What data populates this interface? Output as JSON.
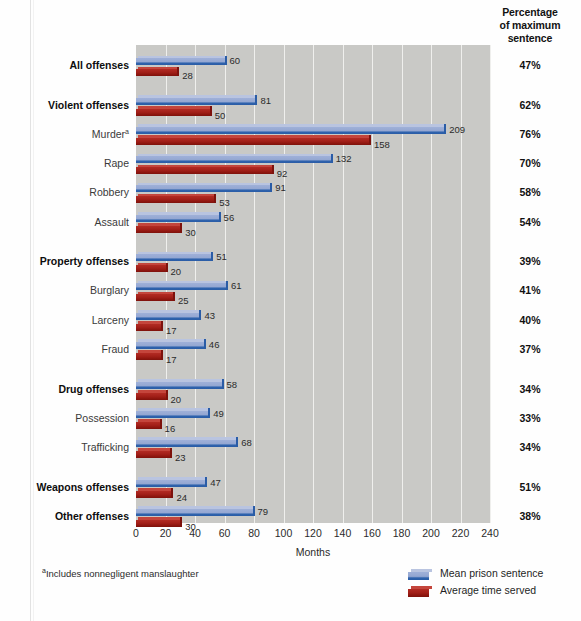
{
  "header": {
    "pct_column_title_line1": "Percentage",
    "pct_column_title_line2": "of maximum",
    "pct_column_title_line3": "sentence"
  },
  "footnote": {
    "marker": "a",
    "text": "Includes nonnegligent manslaughter"
  },
  "legend": {
    "items": [
      {
        "label": "Mean prison sentence",
        "color": "#8fa3cd",
        "icon": "blue-bar-swatch"
      },
      {
        "label": "Average time served",
        "color": "#a32019",
        "icon": "red-bar-swatch"
      }
    ]
  },
  "chart_data": {
    "type": "bar",
    "orientation": "horizontal",
    "title": "",
    "xlabel": "Months",
    "ylabel": "",
    "xlim": [
      0,
      240
    ],
    "xticks": [
      0,
      20,
      40,
      60,
      80,
      100,
      120,
      140,
      160,
      180,
      200,
      220,
      240
    ],
    "xtick_labels": [
      "0",
      "20",
      "40",
      "60",
      "80",
      "100",
      "120",
      "140",
      "160",
      "180",
      "200",
      "220",
      "240"
    ],
    "grid": true,
    "legend_position": "bottom-right",
    "plot_background": "#c9c9c6",
    "categories": [
      "All offenses",
      "Violent offenses",
      "Murder",
      "Rape",
      "Robbery",
      "Assault",
      "Property offenses",
      "Burglary",
      "Larceny",
      "Fraud",
      "Drug offenses",
      "Possession",
      "Trafficking",
      "Weapons offenses",
      "Other offenses"
    ],
    "series": [
      {
        "name": "Mean prison sentence",
        "color": "#8fa3cd",
        "values": [
          60,
          81,
          209,
          132,
          91,
          56,
          51,
          61,
          43,
          46,
          58,
          49,
          68,
          47,
          79
        ]
      },
      {
        "name": "Average time served",
        "color": "#a32019",
        "values": [
          28,
          50,
          158,
          92,
          53,
          30,
          20,
          25,
          17,
          17,
          20,
          16,
          23,
          24,
          30
        ]
      }
    ],
    "secondary_column": {
      "header": "Percentage of maximum sentence",
      "values": [
        "47%",
        "62%",
        "76%",
        "70%",
        "58%",
        "54%",
        "39%",
        "41%",
        "40%",
        "37%",
        "34%",
        "33%",
        "34%",
        "51%",
        "38%"
      ]
    },
    "rows": [
      {
        "label": "All offenses",
        "bold": true,
        "footnote": false,
        "mean": 60,
        "served": 28,
        "pct": "47%",
        "group_gap": false
      },
      {
        "label": "Violent offenses",
        "bold": true,
        "footnote": false,
        "mean": 81,
        "served": 50,
        "pct": "62%",
        "group_gap": true
      },
      {
        "label": "Murder",
        "bold": false,
        "footnote": true,
        "mean": 209,
        "served": 158,
        "pct": "76%",
        "group_gap": false
      },
      {
        "label": "Rape",
        "bold": false,
        "footnote": false,
        "mean": 132,
        "served": 92,
        "pct": "70%",
        "group_gap": false
      },
      {
        "label": "Robbery",
        "bold": false,
        "footnote": false,
        "mean": 91,
        "served": 53,
        "pct": "58%",
        "group_gap": false
      },
      {
        "label": "Assault",
        "bold": false,
        "footnote": false,
        "mean": 56,
        "served": 30,
        "pct": "54%",
        "group_gap": false
      },
      {
        "label": "Property offenses",
        "bold": true,
        "footnote": false,
        "mean": 51,
        "served": 20,
        "pct": "39%",
        "group_gap": true
      },
      {
        "label": "Burglary",
        "bold": false,
        "footnote": false,
        "mean": 61,
        "served": 25,
        "pct": "41%",
        "group_gap": false
      },
      {
        "label": "Larceny",
        "bold": false,
        "footnote": false,
        "mean": 43,
        "served": 17,
        "pct": "40%",
        "group_gap": false
      },
      {
        "label": "Fraud",
        "bold": false,
        "footnote": false,
        "mean": 46,
        "served": 17,
        "pct": "37%",
        "group_gap": false
      },
      {
        "label": "Drug offenses",
        "bold": true,
        "footnote": false,
        "mean": 58,
        "served": 20,
        "pct": "34%",
        "group_gap": true
      },
      {
        "label": "Possession",
        "bold": false,
        "footnote": false,
        "mean": 49,
        "served": 16,
        "pct": "33%",
        "group_gap": false
      },
      {
        "label": "Trafficking",
        "bold": false,
        "footnote": false,
        "mean": 68,
        "served": 23,
        "pct": "34%",
        "group_gap": false
      },
      {
        "label": "Weapons offenses",
        "bold": true,
        "footnote": false,
        "mean": 47,
        "served": 24,
        "pct": "51%",
        "group_gap": true
      },
      {
        "label": "Other offenses",
        "bold": true,
        "footnote": false,
        "mean": 79,
        "served": 30,
        "pct": "38%",
        "group_gap": false
      }
    ]
  }
}
